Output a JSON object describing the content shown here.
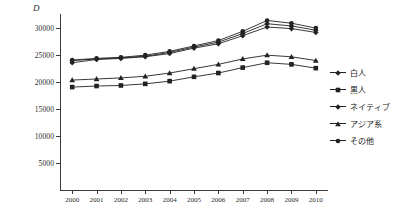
{
  "chart_data": {
    "type": "line",
    "title": "",
    "subtitle": "",
    "xlabel": "",
    "ylabel": "D",
    "ylim": [
      0,
      32500
    ],
    "xlim": [
      2000,
      2010
    ],
    "grid": false,
    "legend_position": "right",
    "categories": [
      "2000",
      "2001",
      "2002",
      "2003",
      "2004",
      "2005",
      "2006",
      "2007",
      "2008",
      "2009",
      "2010"
    ],
    "x": [
      2000,
      2001,
      2002,
      2003,
      2004,
      2005,
      2006,
      2007,
      2008,
      2009,
      2010
    ],
    "y_ticks": [
      5000,
      10000,
      15000,
      20000,
      25000,
      30000
    ],
    "y_tick_labels": [
      "5000",
      "10000",
      "15000",
      "20000",
      "25000",
      "30000"
    ],
    "series": [
      {
        "name": "白人",
        "marker": "diamond",
        "values": [
          23900,
          24200,
          24400,
          24700,
          25400,
          26400,
          27300,
          28900,
          30700,
          30300,
          29500
        ]
      },
      {
        "name": "黒人",
        "marker": "square",
        "values": [
          19000,
          19200,
          19300,
          19600,
          20100,
          20900,
          21600,
          22600,
          23500,
          23200,
          22500
        ]
      },
      {
        "name": "ネイティブ",
        "marker": "diamond",
        "values": [
          23500,
          24100,
          24300,
          24600,
          25200,
          26200,
          27000,
          28500,
          30100,
          29800,
          29100
        ]
      },
      {
        "name": "アジア系",
        "marker": "triangle",
        "values": [
          20300,
          20500,
          20700,
          21000,
          21600,
          22400,
          23200,
          24200,
          24900,
          24600,
          23900
        ]
      },
      {
        "name": "その他",
        "marker": "circle",
        "values": [
          24000,
          24300,
          24500,
          24900,
          25600,
          26600,
          27600,
          29300,
          31300,
          30800,
          29900
        ]
      }
    ],
    "colors": {
      "line": "#222222",
      "axis": "#3a3a3a",
      "text": "#2b2b2b",
      "background": "#ffffff"
    }
  },
  "legend": {
    "items": [
      {
        "label": "白人"
      },
      {
        "label": "黒人"
      },
      {
        "label": "ネイティブ"
      },
      {
        "label": "アジア系"
      },
      {
        "label": "その他"
      }
    ]
  }
}
